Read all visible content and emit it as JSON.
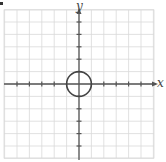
{
  "diagram": {
    "type": "coordinate-grid-with-circle",
    "axes": {
      "x_label": "x",
      "y_label": "y"
    },
    "grid": {
      "x_min": -6,
      "x_max": 6,
      "y_min": -6,
      "y_max": 6,
      "step": 1,
      "tick_marks": true
    },
    "circle": {
      "center": [
        0,
        0
      ],
      "radius": 1
    },
    "colors": {
      "grid": "#d9d9d9",
      "axis": "#555555",
      "circle": "#444444",
      "background": "#ffffff"
    }
  }
}
